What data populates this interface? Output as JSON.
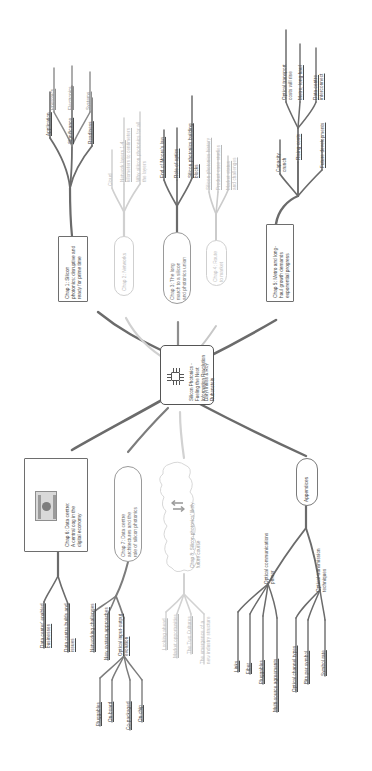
{
  "central": {
    "name": "central-topic",
    "title": "Silicon Photonics -\nFueling the Next\nInformation Revolution",
    "authors": "Daryl Inniss & Roy\nRubenstein",
    "icon": "chip-icon"
  },
  "chapters": [
    {
      "id": "chap1",
      "label": "Chap 1: Silicon\nphotonics: disruptive and\nready for prime time",
      "branches": [
        {
          "label": "Application",
          "underline": false
        },
        {
          "label": "Significance",
          "underline": true
        },
        {
          "label": "Readiness",
          "underline": true
        },
        {
          "label": "Photonics",
          "underline": true
        },
        {
          "label": "Electronics",
          "underline": true
        },
        {
          "label": "Systems",
          "underline": true
        }
      ]
    },
    {
      "id": "chap2",
      "label": "Chap 2: Networks",
      "branches": [
        {
          "label": "Cloud",
          "underline": false
        },
        {
          "label": "Network layers 1-4:\nkilometers to centimeters",
          "underline": true
        },
        {
          "label": "Why silicon photonics for all\nthe layers",
          "underline": false
        }
      ]
    },
    {
      "id": "chap3",
      "label": "Chap 3: The long\nmarch to a silicon\nand photonics union",
      "branches": [
        {
          "label": "End of Moore's law",
          "underline": true
        },
        {
          "label": "Role of optics",
          "underline": true
        },
        {
          "label": "Silicon photonics building\nblocks",
          "underline": true
        }
      ]
    },
    {
      "id": "chap4",
      "label": "Chap 4: Route\nto market",
      "branches": [
        {
          "label": "Silicon photonics history",
          "underline": true
        },
        {
          "label": "Product case studies",
          "underline": true
        },
        {
          "label": "Market status\nand challenges",
          "underline": true
        }
      ]
    },
    {
      "id": "chap5",
      "label": "Chap 5: Metro and long-\nhaul growth demands\nexponential progress",
      "branches": [
        {
          "label": "Capacity\ncrunch",
          "underline": false
        },
        {
          "label": "Rising costs",
          "underline": true
        },
        {
          "label": "Future developments",
          "underline": true
        },
        {
          "label": "Optical transport\ncosts will rise",
          "underline": false
        },
        {
          "label": "Metro, long haul",
          "underline": true
        },
        {
          "label": "Data centre\ninterconnect",
          "underline": true
        }
      ]
    },
    {
      "id": "chap6",
      "label": "Chap 6: Data centre:\nA central cog in the\ndigital economy",
      "branches": [
        {
          "label": "Data center' enabled\nbusinesses",
          "underline": true
        },
        {
          "label": "Data centre builds and\nissues",
          "underline": true
        }
      ]
    },
    {
      "id": "chap7",
      "label": "Chap 7: Data centre\narchitectures and the\nrole of silicon photonics",
      "branches": [
        {
          "label": "Networking challenges",
          "underline": true
        },
        {
          "label": "New system approaches",
          "underline": true
        },
        {
          "label": "Optical input-output\nevolution",
          "underline": true
        },
        {
          "label": "Pluggables",
          "underline": true
        },
        {
          "label": "On-board",
          "underline": true
        },
        {
          "label": "Co-packaged",
          "underline": true
        },
        {
          "label": "On-chip",
          "underline": true
        }
      ]
    },
    {
      "id": "chap8",
      "label": "Chap 8: Silicon photonics' likely\nfuture course",
      "branches": [
        {
          "label": "Looking ahead",
          "underline": true
        },
        {
          "label": "Market opportunities",
          "underline": true
        },
        {
          "label": "The Two Cultures",
          "underline": true
        },
        {
          "label": "The emergence of a\nnew industry structure",
          "underline": false
        }
      ]
    },
    {
      "id": "appendices",
      "label": "Appendices",
      "branches": [
        {
          "label": "Optical communications\nprimer",
          "underline": false
        },
        {
          "label": "Optical transmission\ntechniques",
          "underline": false
        },
        {
          "label": "Links",
          "underline": true
        },
        {
          "label": "Fiber",
          "underline": true
        },
        {
          "label": "Pluggables",
          "underline": true
        },
        {
          "label": "Multi-source agreements",
          "underline": true
        },
        {
          "label": "Optical channel types",
          "underline": true
        },
        {
          "label": "Bits per symbol",
          "underline": true
        },
        {
          "label": "Symbol rate",
          "underline": true
        }
      ]
    }
  ],
  "colors": {
    "ink": "#4a4a4a",
    "dark_branch": "#6b6b6b",
    "mid_branch": "#9a9a9a",
    "pale_branch": "#cfcfcf",
    "node_border": "#6e6e6e",
    "background": "#ffffff"
  }
}
